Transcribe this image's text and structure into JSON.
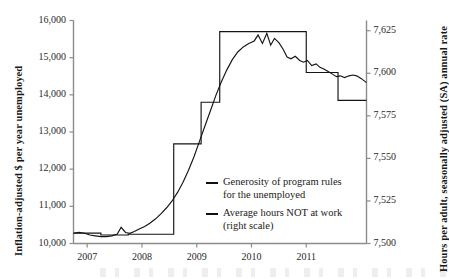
{
  "chart_data": {
    "type": "line",
    "title": "",
    "xlabel": "",
    "x_tick_labels": [
      "2007",
      "2008",
      "2009",
      "2010",
      "2011"
    ],
    "x_ticks": [
      2007,
      2008,
      2009,
      2010,
      2011
    ],
    "xlim": [
      2006.75,
      2012.1
    ],
    "grid": false,
    "legend_position": "inside-lower-right",
    "axes": [
      {
        "id": "left",
        "label": "Inflation-adjusted $ per year unemployed",
        "tick_labels": [
          "10,000",
          "11,000",
          "12,000",
          "13,000",
          "14,000",
          "15,000",
          "16,000"
        ],
        "ticks": [
          10000,
          11000,
          12000,
          13000,
          14000,
          15000,
          16000
        ],
        "lim": [
          10000,
          16000
        ]
      },
      {
        "id": "right",
        "label": "Hours per adult, seasonally adjusted (SA) annual rate",
        "tick_labels": [
          "7,500",
          "7,525",
          "7,550",
          "7,575",
          "7,600",
          "7,625"
        ],
        "ticks": [
          7500,
          7525,
          7550,
          7575,
          7600,
          7625
        ],
        "lim": [
          7500,
          7631
        ]
      }
    ],
    "series": [
      {
        "name": "Generosity of program rules for the unemployed",
        "legend_label": "Generosity of program rules\nfor the unemployed",
        "axis": "left",
        "style": "step",
        "color": "#141414",
        "x": [
          2006.75,
          2007.0,
          2007.25,
          2007.5,
          2007.75,
          2008.0,
          2008.25,
          2008.5,
          2008.58,
          2008.75,
          2009.0,
          2009.08,
          2009.25,
          2009.42,
          2009.58,
          2009.75,
          2010.0,
          2010.25,
          2010.5,
          2010.75,
          2011.0,
          2011.17,
          2011.42,
          2011.58,
          2011.75,
          2012.1
        ],
        "y": [
          10280,
          10280,
          10230,
          10230,
          10250,
          10250,
          10250,
          10250,
          12680,
          12680,
          12680,
          13800,
          13800,
          15700,
          15700,
          15700,
          15700,
          15700,
          15700,
          15700,
          14600,
          14600,
          14600,
          13850,
          13850,
          13850
        ]
      },
      {
        "name": "Average hours NOT at work (right scale)",
        "legend_label": "Average hours NOT at work\n(right scale)",
        "axis": "right",
        "style": "line",
        "color": "#141414",
        "x": [
          2006.75,
          2006.85,
          2006.95,
          2007.05,
          2007.15,
          2007.25,
          2007.35,
          2007.45,
          2007.55,
          2007.62,
          2007.7,
          2007.78,
          2007.86,
          2007.95,
          2008.05,
          2008.15,
          2008.25,
          2008.35,
          2008.45,
          2008.55,
          2008.65,
          2008.75,
          2008.85,
          2008.95,
          2009.05,
          2009.15,
          2009.25,
          2009.35,
          2009.45,
          2009.55,
          2009.65,
          2009.75,
          2009.85,
          2009.95,
          2010.05,
          2010.12,
          2010.2,
          2010.28,
          2010.35,
          2010.42,
          2010.5,
          2010.58,
          2010.65,
          2010.72,
          2010.8,
          2010.88,
          2010.95,
          2011.02,
          2011.1,
          2011.18,
          2011.25,
          2011.32,
          2011.4,
          2011.48,
          2011.55,
          2011.62,
          2011.7,
          2011.78,
          2011.85,
          2011.92,
          2012.0,
          2012.1
        ],
        "y": [
          7506.0,
          7506.5,
          7506.0,
          7505.0,
          7504.5,
          7504.0,
          7504.0,
          7504.5,
          7505.5,
          7509.5,
          7506.5,
          7506.0,
          7507.0,
          7508.5,
          7510.0,
          7512.0,
          7514.5,
          7517.5,
          7521.0,
          7525.0,
          7530.0,
          7536.0,
          7543.0,
          7551.0,
          7560.0,
          7569.0,
          7578.0,
          7587.0,
          7595.0,
          7602.0,
          7608.0,
          7612.5,
          7615.5,
          7617.5,
          7619.0,
          7622.5,
          7617.5,
          7623.5,
          7616.5,
          7620.5,
          7618.0,
          7614.0,
          7609.5,
          7608.5,
          7610.0,
          7607.5,
          7606.5,
          7607.5,
          7604.5,
          7605.5,
          7603.5,
          7602.5,
          7601.0,
          7599.5,
          7598.0,
          7598.5,
          7597.5,
          7598.5,
          7599.0,
          7598.5,
          7597.0,
          7594.5
        ]
      }
    ]
  },
  "legend": {
    "items": [
      {
        "label": "Generosity of program rules\nfor the unemployed"
      },
      {
        "label": "Average hours NOT at work\n(right scale)"
      }
    ]
  }
}
